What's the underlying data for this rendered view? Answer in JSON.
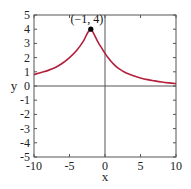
{
  "chart_data": {
    "type": "line",
    "title": "",
    "xlabel": "x",
    "ylabel": "y",
    "xlim": [
      -10,
      10
    ],
    "ylim": [
      -5,
      5
    ],
    "grid": false,
    "legend": null,
    "x_ticks": [
      -10,
      -5,
      0,
      5,
      10
    ],
    "x_tick_labels": [
      "-10",
      "-5",
      "0",
      "5",
      "10"
    ],
    "y_ticks": [
      -5,
      -4,
      -3,
      -2,
      -1,
      0,
      1,
      2,
      3,
      4,
      5
    ],
    "y_tick_labels": [
      "-5",
      "-4",
      "-3",
      "-2",
      "-1",
      "0",
      "1",
      "2",
      "3",
      "4",
      "5"
    ],
    "series": [
      {
        "name": "curve",
        "color": "#b2203c",
        "x": [
          -10,
          -9,
          -8,
          -7,
          -6,
          -5,
          -4,
          -3,
          -2.5,
          -2,
          -1.5,
          -1,
          -0.5,
          0,
          0.5,
          1,
          1.5,
          2,
          2.5,
          3,
          4,
          5,
          6,
          7,
          8,
          9,
          10
        ],
        "y": [
          0.8,
          0.95,
          1.1,
          1.3,
          1.6,
          2.0,
          2.5,
          3.2,
          3.7,
          4.0,
          3.6,
          3.1,
          2.7,
          2.3,
          1.95,
          1.65,
          1.4,
          1.2,
          1.05,
          0.92,
          0.72,
          0.57,
          0.45,
          0.36,
          0.28,
          0.22,
          0.17
        ]
      }
    ],
    "annotations": [
      {
        "text": "(−1, 4)",
        "point": [
          -2,
          4
        ],
        "marker": "filled-circle",
        "marker_color": "#000000"
      }
    ]
  }
}
